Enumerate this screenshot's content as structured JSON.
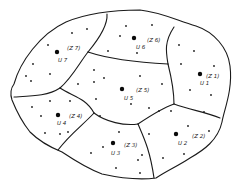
{
  "diagram": {
    "type": "zone partition map (Voronoi-like regions with demand points)",
    "colors": {
      "line": "#1a1a1a",
      "background": "#ffffff"
    },
    "zones": [
      {
        "id": "Z1",
        "label": "(Z 1)",
        "center_label": "U 1",
        "center": [
          200,
          74
        ],
        "label_pos": [
          206,
          78
        ],
        "ulabel_pos": [
          200,
          85
        ]
      },
      {
        "id": "Z2",
        "label": "(Z 2)",
        "center_label": "U 2",
        "center": [
          176,
          134
        ],
        "label_pos": [
          192,
          138
        ],
        "ulabel_pos": [
          178,
          145
        ]
      },
      {
        "id": "Z3",
        "label": "(Z 3)",
        "center_label": "U 3",
        "center": [
          113,
          143
        ],
        "label_pos": [
          124,
          147
        ],
        "ulabel_pos": [
          111,
          155
        ]
      },
      {
        "id": "Z4",
        "label": "(Z 4)",
        "center_label": "U 4",
        "center": [
          58,
          115
        ],
        "label_pos": [
          69,
          118
        ],
        "ulabel_pos": [
          57,
          125
        ]
      },
      {
        "id": "Z5",
        "label": "(Z 5)",
        "center_label": "U 5",
        "center": [
          122,
          89
        ],
        "label_pos": [
          136,
          92
        ],
        "ulabel_pos": [
          124,
          100
        ]
      },
      {
        "id": "Z6",
        "label": "(Z 6)",
        "center_label": "U 6",
        "center": [
          134,
          38
        ],
        "label_pos": [
          147,
          42
        ],
        "ulabel_pos": [
          136,
          49
        ]
      },
      {
        "id": "Z7",
        "label": "(Z 7)",
        "center_label": "U 7",
        "center": [
          57,
          52
        ],
        "label_pos": [
          67,
          50
        ],
        "ulabel_pos": [
          58,
          62
        ]
      }
    ],
    "demand_points": [
      [
        72,
        33
      ],
      [
        87,
        29
      ],
      [
        48,
        45
      ],
      [
        33,
        64
      ],
      [
        26,
        76
      ],
      [
        31,
        81
      ],
      [
        50,
        74
      ],
      [
        78,
        84
      ],
      [
        94,
        70
      ],
      [
        94,
        82
      ],
      [
        108,
        51
      ],
      [
        104,
        78
      ],
      [
        126,
        26
      ],
      [
        152,
        25
      ],
      [
        120,
        36
      ],
      [
        137,
        53
      ],
      [
        179,
        45
      ],
      [
        194,
        51
      ],
      [
        181,
        64
      ],
      [
        214,
        66
      ],
      [
        190,
        90
      ],
      [
        211,
        95
      ],
      [
        140,
        76
      ],
      [
        162,
        84
      ],
      [
        131,
        104
      ],
      [
        149,
        108
      ],
      [
        149,
        134
      ],
      [
        159,
        111
      ],
      [
        171,
        111
      ],
      [
        204,
        112
      ],
      [
        188,
        126
      ],
      [
        209,
        131
      ],
      [
        163,
        158
      ],
      [
        184,
        154
      ],
      [
        138,
        160
      ],
      [
        116,
        168
      ],
      [
        140,
        173
      ],
      [
        91,
        153
      ],
      [
        32,
        107
      ],
      [
        50,
        101
      ],
      [
        70,
        101
      ],
      [
        96,
        99
      ],
      [
        41,
        116
      ],
      [
        68,
        132
      ],
      [
        45,
        133
      ],
      [
        60,
        134
      ],
      [
        100,
        116
      ],
      [
        119,
        132
      ],
      [
        103,
        147
      ],
      [
        142,
        155
      ]
    ]
  }
}
